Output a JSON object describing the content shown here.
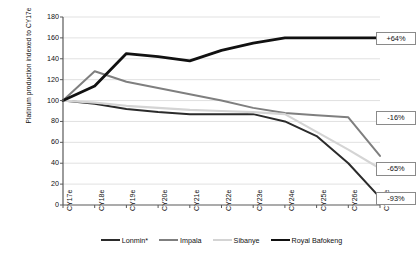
{
  "chart_data": {
    "type": "line",
    "title": "",
    "xlabel": "",
    "ylabel": "Platinum production indexed to CY17e",
    "categories": [
      "CY17e",
      "CY18e",
      "CY19e",
      "CY20e",
      "CY21e",
      "CY22e",
      "CY23e",
      "CY24e",
      "CY25e",
      "CY26e",
      "CY27e"
    ],
    "ylim": [
      0,
      180
    ],
    "ytick_values": [
      0,
      20,
      40,
      60,
      80,
      100,
      120,
      140,
      160,
      180
    ],
    "grid": true,
    "legend_position": "bottom",
    "series": [
      {
        "name": "Lonmin*",
        "color": "#2b2b2b",
        "width": 2.0,
        "values": [
          100,
          97,
          92,
          89,
          87,
          87,
          87,
          80,
          66,
          40,
          7
        ]
      },
      {
        "name": "Impala",
        "color": "#7f7f7f",
        "width": 2.0,
        "values": [
          100,
          128,
          118,
          112,
          106,
          100,
          93,
          88,
          86,
          84,
          47
        ]
      },
      {
        "name": "Sibanye",
        "color": "#d4d4d4",
        "width": 2.2,
        "values": [
          100,
          98,
          95,
          93,
          91,
          90,
          89,
          87,
          70,
          53,
          35
        ]
      },
      {
        "name": "Royal Bafokeng",
        "color": "#111111",
        "width": 2.8,
        "values": [
          100,
          114,
          145,
          142,
          138,
          148,
          155,
          160,
          160,
          160,
          160
        ]
      }
    ],
    "annotations": [
      {
        "label": "+64%",
        "series": "Royal Bafokeng",
        "value": 160
      },
      {
        "label": "-16%",
        "series": "Impala",
        "value": 84
      },
      {
        "label": "-65%",
        "series": "Sibanye",
        "value": 35
      },
      {
        "label": "-93%",
        "series": "Lonmin*",
        "value": 7
      }
    ]
  }
}
